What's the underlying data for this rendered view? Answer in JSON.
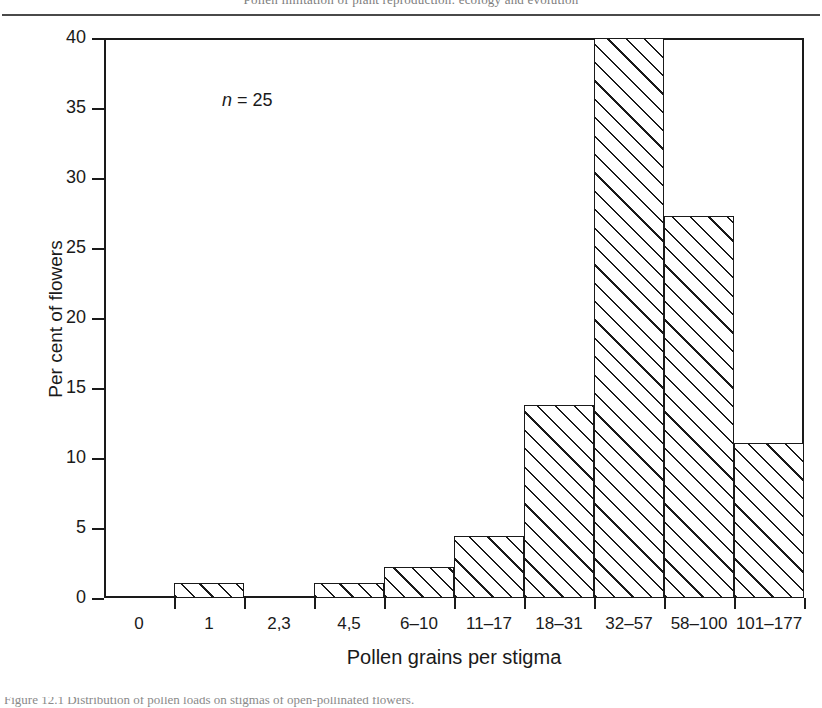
{
  "page": {
    "header_fragment": "Pollen limitation of plant reproduction: ecology and evolution",
    "caption_fragment": "Figure 12.1   Distribution of pollen loads on stigmas of open-pollinated flowers."
  },
  "annotation": {
    "symbol": "n",
    "text": " = 25",
    "full": "n = 25"
  },
  "chart_data": {
    "type": "bar",
    "title": "",
    "subtitle": "",
    "xlabel": "Pollen grains per stigma",
    "ylabel": "Per cent of flowers",
    "categories": [
      "0",
      "1",
      "2,3",
      "4,5",
      "6–10",
      "11–17",
      "18–31",
      "32–57",
      "58–100",
      "101–177"
    ],
    "values": [
      0,
      1.1,
      0,
      1.1,
      2.2,
      4.4,
      13.8,
      40.0,
      27.3,
      11.1
    ],
    "ylim": [
      0,
      40
    ],
    "yticks": [
      0,
      5,
      10,
      15,
      20,
      25,
      30,
      35,
      40
    ],
    "ytick_labels": [
      "0",
      "5",
      "10",
      "15",
      "20",
      "25",
      "30",
      "35",
      "40"
    ],
    "grid": false,
    "legend": "none",
    "bar_fill": "diagonal-hatch",
    "n": 25
  },
  "colors": {
    "ink": "#1a1a1a",
    "background": "#ffffff",
    "hatch": "#1a1a1a"
  }
}
